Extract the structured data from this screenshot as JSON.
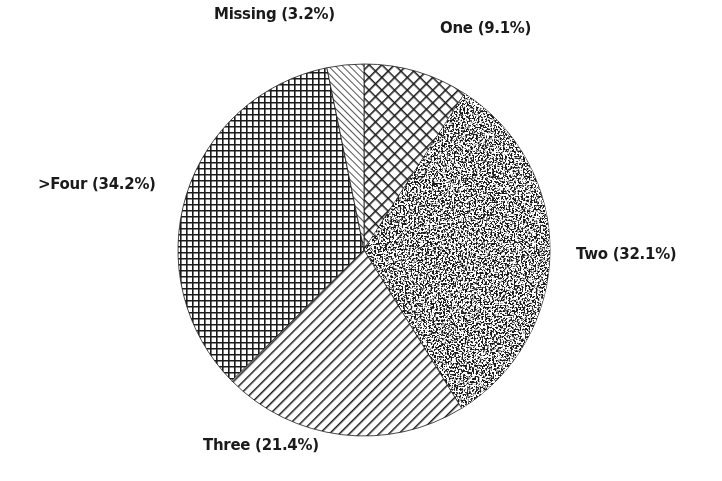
{
  "chart_data": {
    "type": "pie",
    "title": "",
    "start_angle_deg": 0,
    "direction": "clockwise",
    "center": [
      364,
      250
    ],
    "radius": 186,
    "slices": [
      {
        "label": "One",
        "value": 9.1,
        "display": "One (9.1%)",
        "pattern": "diag-crosshatch"
      },
      {
        "label": "Two",
        "value": 32.1,
        "display": "Two (32.1%)",
        "pattern": "dark-speckle"
      },
      {
        "label": "Three",
        "value": 21.4,
        "display": "Three (21.4%)",
        "pattern": "diagonal-lines"
      },
      {
        "label": ">Four",
        "value": 34.2,
        "display": ">Four (34.2%)",
        "pattern": "grid"
      },
      {
        "label": "Missing",
        "value": 3.2,
        "display": "Missing (3.2%)",
        "pattern": "fine-diagonal"
      }
    ],
    "legend": "none (labels placed around pie)",
    "grid": false
  },
  "labels": {
    "missing": "Missing (3.2%)",
    "one": "One (9.1%)",
    "two": "Two (32.1%)",
    "three": "Three (21.4%)",
    "four": ">Four (34.2%)"
  },
  "colors": {
    "ink": "#1a1a1a",
    "background": "#ffffff"
  }
}
